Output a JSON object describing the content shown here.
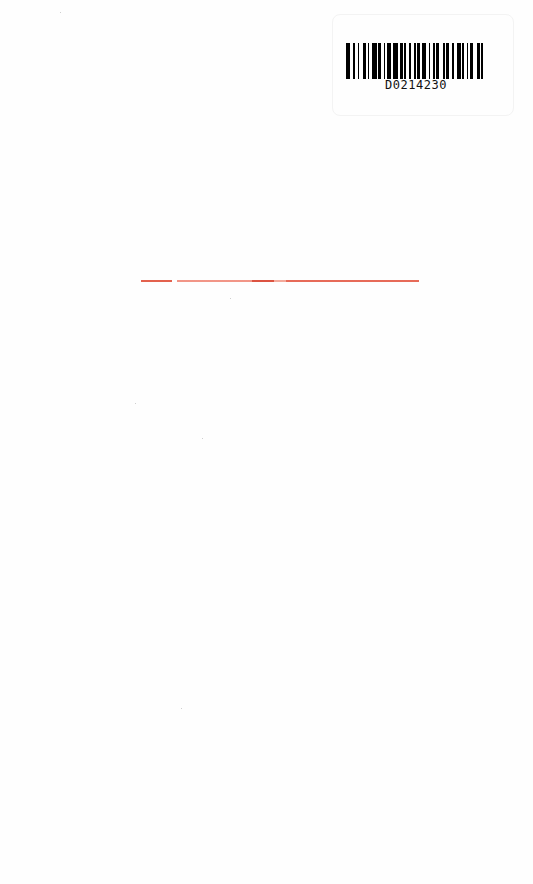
{
  "page": {
    "background": "#fefefe",
    "type": "scanned blank book page"
  },
  "barcode": {
    "code": "D0214230",
    "bar_color": "#000000",
    "pattern": [
      3,
      2,
      1,
      2,
      1,
      3,
      2,
      1,
      1,
      2,
      3,
      1,
      2,
      2,
      1,
      1,
      3,
      1,
      4,
      1,
      2,
      1,
      1,
      2,
      2,
      2,
      1,
      1,
      2,
      1,
      3,
      2,
      1,
      2,
      1,
      1,
      2,
      3,
      1,
      1,
      2,
      2,
      1,
      2,
      3,
      1,
      1,
      2,
      1,
      1,
      2,
      3,
      2,
      1,
      1,
      2
    ]
  },
  "rule": {
    "color": "#e0503a"
  }
}
